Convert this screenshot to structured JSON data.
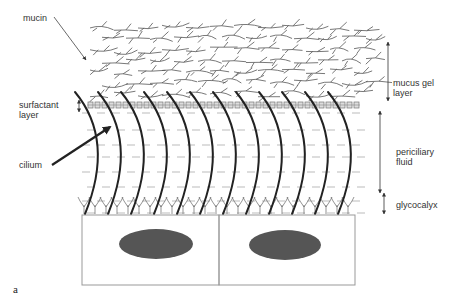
{
  "figure": {
    "panel_label": "a",
    "labels": {
      "mucin": "mucin",
      "surfactant_layer": "surfactant\nlayer",
      "cilium": "cilium",
      "mucus_gel_layer": "mucus gel\nlayer",
      "periciliary_fluid": "periciliary\nfluid",
      "glycocalyx": "glycocalyx"
    },
    "cilia_count": 12,
    "cell_count": 2,
    "colors": {
      "line": "#222222",
      "mucin_strands": "#444444",
      "dashes": "#999999",
      "nucleus": "#555555",
      "cell_border": "#999999"
    }
  }
}
